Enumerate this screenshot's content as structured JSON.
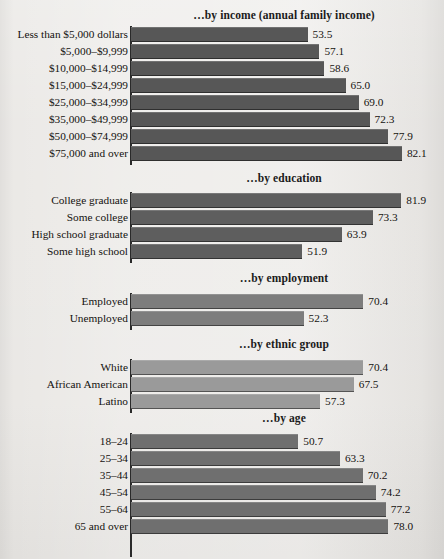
{
  "chart_data": {
    "type": "bar",
    "orientation": "horizontal",
    "title": "",
    "xlabel": "",
    "ylabel": "",
    "xlim": [
      0,
      90
    ],
    "grid": false,
    "legend": "none",
    "value_label_format": "one decimal",
    "panels": [
      {
        "title": "…by income (annual family income)",
        "bar_color": "#575757",
        "categories": [
          "Less than $5,000 dollars",
          "$5,000–$9,999",
          "$10,000–$14,999",
          "$15,000–$24,999",
          "$25,000–$34,999",
          "$35,000–$49,999",
          "$50,000–$74,999",
          "$75,000 and over"
        ],
        "values": [
          53.5,
          57.1,
          58.6,
          65.0,
          69.0,
          72.3,
          77.9,
          82.1
        ],
        "value_labels": [
          "53.5",
          "57.1",
          "58.6",
          "65.0",
          "69.0",
          "72.3",
          "77.9",
          "82.1"
        ]
      },
      {
        "title": "…by education",
        "bar_color": "#5e5e5e",
        "categories": [
          "College graduate",
          "Some college",
          "High school graduate",
          "Some high school"
        ],
        "values": [
          81.9,
          73.3,
          63.9,
          51.9
        ],
        "value_labels": [
          "81.9",
          "73.3",
          "63.9",
          "51.9"
        ]
      },
      {
        "title": "…by employment",
        "bar_color": "#7d7d7d",
        "categories": [
          "Employed",
          "Unemployed"
        ],
        "values": [
          70.4,
          52.3
        ],
        "value_labels": [
          "70.4",
          "52.3"
        ]
      },
      {
        "title": "…by ethnic group",
        "bar_color": "#9a9a9a",
        "categories": [
          "White",
          "African American",
          "Latino"
        ],
        "values": [
          70.4,
          67.5,
          57.3
        ],
        "value_labels": [
          "70.4",
          "67.5",
          "57.3"
        ]
      },
      {
        "title": "…by age",
        "bar_color": "#6f6f6f",
        "categories": [
          "18–24",
          "25–34",
          "35–44",
          "45–54",
          "55–64",
          "65 and over"
        ],
        "values": [
          50.7,
          63.3,
          70.2,
          74.2,
          77.2,
          78.0
        ],
        "value_labels": [
          "50.7",
          "63.3",
          "70.2",
          "74.2",
          "77.2",
          "78.0"
        ]
      }
    ]
  },
  "layout": {
    "axis_x": 131,
    "px_per_unit": 3.3,
    "row_pitch": 17,
    "bar_height": 15,
    "panel_tops": [
      9,
      172,
      272,
      338,
      412
    ],
    "panel_bar_offsets": [
      18,
      21,
      22,
      22,
      22
    ]
  }
}
